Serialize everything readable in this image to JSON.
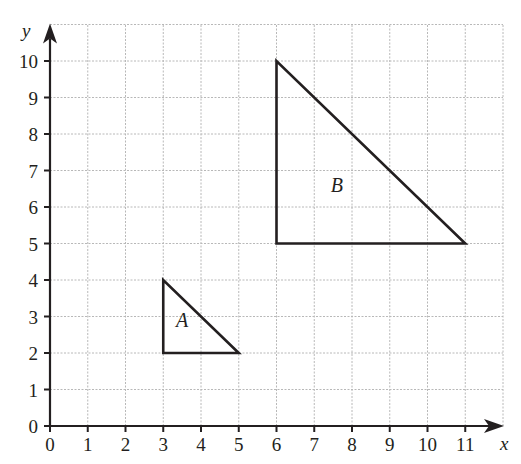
{
  "diagram": {
    "type": "coordinate-grid",
    "header_fragment": "p",
    "axes": {
      "x": {
        "label": "x",
        "min": 0,
        "max": 12,
        "ticks": [
          0,
          1,
          2,
          3,
          4,
          5,
          6,
          7,
          8,
          9,
          10,
          11
        ]
      },
      "y": {
        "label": "y",
        "min": 0,
        "max": 11,
        "ticks": [
          0,
          1,
          2,
          3,
          4,
          5,
          6,
          7,
          8,
          9,
          10
        ]
      }
    },
    "grid": {
      "on": true,
      "style": "dotted",
      "color": "#b8b8b8"
    },
    "shapes": [
      {
        "name": "A",
        "type": "triangle",
        "vertices": [
          [
            3,
            4
          ],
          [
            3,
            2
          ],
          [
            5,
            2
          ]
        ],
        "label": "A",
        "label_pos": [
          3.5,
          2.7
        ]
      },
      {
        "name": "B",
        "type": "triangle",
        "vertices": [
          [
            6,
            10
          ],
          [
            6,
            5
          ],
          [
            11,
            5
          ]
        ],
        "label": "B",
        "label_pos": [
          7.6,
          6.4
        ]
      }
    ],
    "colors": {
      "ink": "#231f20",
      "grid": "#b8b8b8",
      "background": "#ffffff"
    }
  }
}
